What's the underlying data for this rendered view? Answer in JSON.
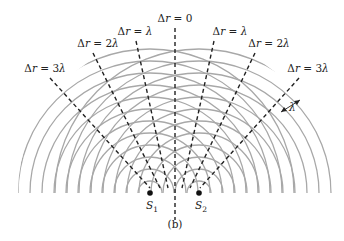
{
  "figure": {
    "panel_label": "(b)",
    "sources": [
      {
        "label": "S",
        "subscript": "1",
        "x": 150,
        "y": 193
      },
      {
        "label": "S",
        "subscript": "2",
        "x": 199,
        "y": 193
      }
    ],
    "wavelength_label": "λ",
    "wavefront_spacing_px": 12,
    "wavefront_count": 12,
    "arc_color": "#a8a8a8",
    "line_color": "#222222",
    "path_difference_lines": [
      {
        "label": "Δr = 3λ",
        "side": "left",
        "label_x": 45,
        "label_y": 72,
        "x1": 50,
        "y1": 78,
        "x2": 150,
        "y2": 188
      },
      {
        "label": "Δr = 2λ",
        "side": "left",
        "label_x": 98,
        "label_y": 47,
        "x1": 93,
        "y1": 53,
        "x2": 160,
        "y2": 188
      },
      {
        "label": "Δr = λ",
        "side": "left",
        "label_x": 135,
        "label_y": 35,
        "x1": 136,
        "y1": 41,
        "x2": 168,
        "y2": 188
      },
      {
        "label": "Δr = 0",
        "side": "center",
        "label_x": 175,
        "label_y": 22,
        "x1": 175,
        "y1": 28,
        "x2": 175,
        "y2": 220
      },
      {
        "label": "Δr = λ",
        "side": "right",
        "label_x": 230,
        "label_y": 35,
        "x1": 214,
        "y1": 41,
        "x2": 182,
        "y2": 188
      },
      {
        "label": "Δr = 2λ",
        "side": "right",
        "label_x": 269,
        "label_y": 47,
        "x1": 255,
        "y1": 53,
        "x2": 190,
        "y2": 188
      },
      {
        "label": "Δr = 3λ",
        "side": "right",
        "label_x": 308,
        "label_y": 72,
        "x1": 299,
        "y1": 78,
        "x2": 200,
        "y2": 188
      }
    ]
  }
}
